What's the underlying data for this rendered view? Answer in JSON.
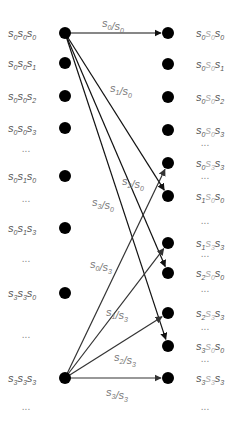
{
  "diagram": {
    "type": "trellis-transition",
    "colors": {
      "node": "#000000",
      "edge": "#111111",
      "edge_light": "#333333",
      "label": "#555555",
      "label_mid": "#aaaaaa",
      "dots": "#888888"
    },
    "left_column": {
      "x": 65,
      "label_x": 33,
      "items": [
        {
          "kind": "node",
          "y": 33,
          "label": [
            "s",
            "0",
            "s",
            "0",
            "s",
            "0"
          ]
        },
        {
          "kind": "node",
          "y": 63,
          "label": [
            "s",
            "0",
            "s",
            "0",
            "s",
            "1"
          ]
        },
        {
          "kind": "node",
          "y": 96,
          "label": [
            "s",
            "0",
            "s",
            "0",
            "s",
            "2"
          ]
        },
        {
          "kind": "node",
          "y": 128,
          "label": [
            "s",
            "0",
            "s",
            "0",
            "s",
            "3"
          ]
        },
        {
          "kind": "dots",
          "y": 152,
          "label": "..."
        },
        {
          "kind": "node",
          "y": 176,
          "label": [
            "s",
            "0",
            "s",
            "1",
            "s",
            "0"
          ]
        },
        {
          "kind": "dots",
          "y": 202,
          "label": "..."
        },
        {
          "kind": "node",
          "y": 228,
          "label": [
            "s",
            "0",
            "s",
            "1",
            "s",
            "3"
          ]
        },
        {
          "kind": "dots",
          "y": 262,
          "label": "..."
        },
        {
          "kind": "node",
          "y": 293,
          "label": [
            "s",
            "3",
            "s",
            "3",
            "s",
            "0"
          ]
        },
        {
          "kind": "dots",
          "y": 338,
          "label": "..."
        },
        {
          "kind": "node",
          "y": 378,
          "label": [
            "s",
            "3",
            "s",
            "3",
            "s",
            "3"
          ]
        },
        {
          "kind": "dots",
          "y": 410,
          "label": "..."
        }
      ]
    },
    "right_column": {
      "x": 168,
      "label_x": 196,
      "items": [
        {
          "kind": "node",
          "y": 33,
          "label": [
            "s",
            "0",
            "s",
            "0",
            "s",
            "0"
          ]
        },
        {
          "kind": "node",
          "y": 64,
          "label": [
            "s",
            "0",
            "s",
            "0",
            "s",
            "1"
          ]
        },
        {
          "kind": "node",
          "y": 97,
          "label": [
            "s",
            "0",
            "s",
            "0",
            "s",
            "2"
          ]
        },
        {
          "kind": "node",
          "y": 130,
          "label": [
            "s",
            "0",
            "s",
            "0",
            "s",
            "3"
          ]
        },
        {
          "kind": "dots",
          "y": 146,
          "label": "..."
        },
        {
          "kind": "node",
          "y": 163,
          "label": [
            "s",
            "0",
            "s",
            "3",
            "s",
            "3"
          ]
        },
        {
          "kind": "dots",
          "y": 179,
          "label": "..."
        },
        {
          "kind": "node",
          "y": 196,
          "label": [
            "s",
            "1",
            "s",
            "0",
            "s",
            "0"
          ]
        },
        {
          "kind": "dots",
          "y": 224,
          "label": "..."
        },
        {
          "kind": "node",
          "y": 243,
          "label": [
            "s",
            "1",
            "s",
            "3",
            "s",
            "3"
          ]
        },
        {
          "kind": "dots",
          "y": 257,
          "label": "..."
        },
        {
          "kind": "node",
          "y": 273,
          "label": [
            "s",
            "2",
            "s",
            "0",
            "s",
            "0"
          ]
        },
        {
          "kind": "dots",
          "y": 292,
          "label": "..."
        },
        {
          "kind": "node",
          "y": 313,
          "label": [
            "s",
            "2",
            "s",
            "3",
            "s",
            "3"
          ]
        },
        {
          "kind": "dots",
          "y": 330,
          "label": "..."
        },
        {
          "kind": "node",
          "y": 346,
          "label": [
            "s",
            "3",
            "s",
            "0",
            "s",
            "0"
          ]
        },
        {
          "kind": "dots",
          "y": 362,
          "label": "..."
        },
        {
          "kind": "node",
          "y": 378,
          "label": [
            "s",
            "3",
            "s",
            "3",
            "s",
            "3"
          ]
        },
        {
          "kind": "dots",
          "y": 410,
          "label": "..."
        }
      ]
    },
    "edges": [
      {
        "from_y": 33,
        "to_y": 33,
        "label": [
          "s",
          "0",
          "/",
          "s",
          "0"
        ],
        "label_x": 102,
        "label_y": 27,
        "shade": "dark"
      },
      {
        "from_y": 33,
        "to_y": 196,
        "label": [
          "s",
          "1",
          "/",
          "s",
          "0"
        ],
        "label_x": 110,
        "label_y": 92,
        "shade": "dark"
      },
      {
        "from_y": 33,
        "to_y": 273,
        "label": [
          "s",
          "2",
          "/",
          "s",
          "0"
        ],
        "label_x": 122,
        "label_y": 185,
        "shade": "dark"
      },
      {
        "from_y": 33,
        "to_y": 346,
        "label": [
          "s",
          "3",
          "/",
          "s",
          "0"
        ],
        "label_x": 92,
        "label_y": 206,
        "shade": "dark"
      },
      {
        "from_y": 378,
        "to_y": 163,
        "label": [
          "s",
          "0",
          "/",
          "s",
          "3"
        ],
        "label_x": 90,
        "label_y": 268,
        "shade": "light"
      },
      {
        "from_y": 378,
        "to_y": 243,
        "label": [
          "s",
          "1",
          "/",
          "s",
          "3"
        ],
        "label_x": 106,
        "label_y": 316,
        "shade": "light"
      },
      {
        "from_y": 378,
        "to_y": 313,
        "label": [
          "s",
          "2",
          "/",
          "s",
          "3"
        ],
        "label_x": 114,
        "label_y": 361,
        "shade": "light"
      },
      {
        "from_y": 378,
        "to_y": 378,
        "label": [
          "s",
          "3",
          "/",
          "s",
          "3"
        ],
        "label_x": 106,
        "label_y": 396,
        "shade": "light"
      }
    ]
  }
}
